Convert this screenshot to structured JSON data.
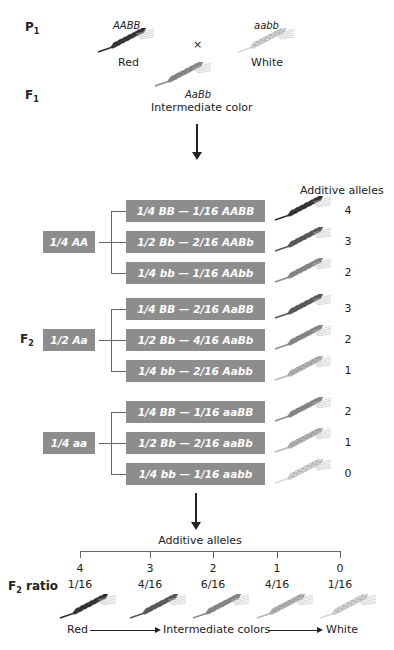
{
  "p1": {
    "label": "P",
    "sub": "1",
    "red": {
      "genotype": "AABB",
      "phenotype": "Red",
      "shade": "#2a2a2a"
    },
    "cross": "×",
    "white": {
      "genotype": "aabb",
      "phenotype": "White",
      "shade": "#d8d8d8"
    }
  },
  "f1": {
    "label": "F",
    "sub": "1",
    "genotype": "AaBb",
    "phenotype": "Intermediate color",
    "shade": "#8a8a8a"
  },
  "f2": {
    "label": "F",
    "sub": "2",
    "header": "Additive alleles",
    "box_color": "#8d8d8d",
    "groups": [
      {
        "parent": "1/4 AA",
        "rows": [
          {
            "text": "1/4 BB  —  1/16 AABB",
            "alleles": "4",
            "shade": "#2a2a2a"
          },
          {
            "text": "1/2 Bb  —  2/16 AABb",
            "alleles": "3",
            "shade": "#555555"
          },
          {
            "text": "1/4 bb  —  1/16 AAbb",
            "alleles": "2",
            "shade": "#8a8a8a"
          }
        ]
      },
      {
        "parent": "1/2 Aa",
        "rows": [
          {
            "text": "1/4 BB  —  2/16 AaBB",
            "alleles": "3",
            "shade": "#555555"
          },
          {
            "text": "1/2 Bb  —  4/16 AaBb",
            "alleles": "2",
            "shade": "#8a8a8a"
          },
          {
            "text": "1/4 bb  —  2/16 Aabb",
            "alleles": "1",
            "shade": "#b5b5b5"
          }
        ]
      },
      {
        "parent": "1/4 aa",
        "rows": [
          {
            "text": "1/4 BB  —  1/16 aaBB",
            "alleles": "2",
            "shade": "#8a8a8a"
          },
          {
            "text": "1/2 Bb  —  2/16 aaBb",
            "alleles": "1",
            "shade": "#b5b5b5"
          },
          {
            "text": "1/4 bb  —  1/16 aabb",
            "alleles": "0",
            "shade": "#d8d8d8"
          }
        ]
      }
    ]
  },
  "ratio": {
    "header": "Additive alleles",
    "label": "F",
    "sub": "2",
    "label_rest": " ratio",
    "columns": [
      {
        "alleles": "4",
        "ratio": "1/16",
        "shade": "#2a2a2a"
      },
      {
        "alleles": "3",
        "ratio": "4/16",
        "shade": "#555555"
      },
      {
        "alleles": "2",
        "ratio": "6/16",
        "shade": "#8a8a8a"
      },
      {
        "alleles": "1",
        "ratio": "4/16",
        "shade": "#b5b5b5"
      },
      {
        "alleles": "0",
        "ratio": "1/16",
        "shade": "#d8d8d8"
      }
    ],
    "scale": {
      "left": "Red",
      "middle": "Intermediate colors",
      "right": "White"
    }
  }
}
